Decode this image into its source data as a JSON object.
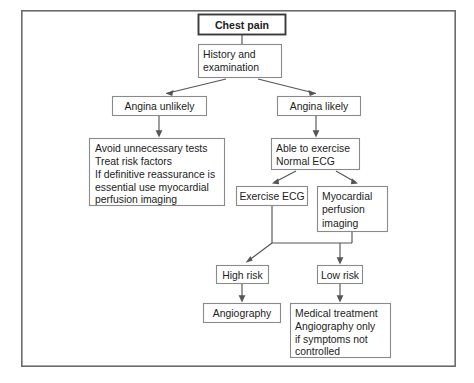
{
  "diagram": {
    "title_node": "Chest pain",
    "frame": {
      "x": 21,
      "y": 10,
      "width": 435,
      "height": 357
    },
    "accent_colors": {
      "frame_border": "#6b6b6b",
      "node_border": "#8a8a8a",
      "emphasis_border": "#3a3a3a",
      "connector": "#555555",
      "text": "#1c1c1c",
      "background": "#ffffff"
    },
    "nodes": [
      {
        "id": "chest-pain",
        "label": "Chest pain",
        "lines": [
          "Chest pain"
        ],
        "bold": true,
        "emphasis": true,
        "align": "center",
        "x": 198,
        "y": 14,
        "width": 88,
        "height": 21
      },
      {
        "id": "history-examination",
        "label": "History and examination",
        "lines": [
          "History and",
          "examination"
        ],
        "bold": false,
        "emphasis": false,
        "align": "left",
        "x": 198,
        "y": 44,
        "width": 84,
        "height": 34
      },
      {
        "id": "angina-unlikely",
        "label": "Angina unlikely",
        "lines": [
          "Angina unlikely"
        ],
        "bold": false,
        "emphasis": false,
        "align": "center",
        "x": 112,
        "y": 96,
        "width": 95,
        "height": 20
      },
      {
        "id": "angina-likely",
        "label": "Angina likely",
        "lines": [
          "Angina likely"
        ],
        "bold": false,
        "emphasis": false,
        "align": "center",
        "x": 277,
        "y": 96,
        "width": 84,
        "height": 20
      },
      {
        "id": "conservative-management",
        "label": "Avoid unnecessary tests",
        "lines": [
          "Avoid unnecessary tests",
          "Treat risk factors",
          "If definitive reassurance is",
          "essential use myocardial",
          "perfusion imaging"
        ],
        "bold": false,
        "emphasis": false,
        "align": "left",
        "x": 89,
        "y": 138,
        "width": 136,
        "height": 68
      },
      {
        "id": "able-to-exercise",
        "label": "Able to exercise Normal ECG",
        "lines": [
          "Able to exercise",
          "Normal ECG"
        ],
        "bold": false,
        "emphasis": false,
        "align": "left",
        "x": 271,
        "y": 138,
        "width": 89,
        "height": 32
      },
      {
        "id": "exercise-ecg",
        "label": "Exercise ECG",
        "lines": [
          "Exercise ECG"
        ],
        "bold": false,
        "emphasis": false,
        "align": "center",
        "x": 236,
        "y": 186,
        "width": 72,
        "height": 20
      },
      {
        "id": "myocardial-perfusion-imaging",
        "label": "Myocardial perfusion imaging",
        "lines": [
          "Myocardial",
          "perfusion",
          "imaging"
        ],
        "bold": false,
        "emphasis": false,
        "align": "left",
        "x": 317,
        "y": 186,
        "width": 71,
        "height": 46
      },
      {
        "id": "high-risk",
        "label": "High risk",
        "lines": [
          "High risk"
        ],
        "bold": false,
        "emphasis": false,
        "align": "center",
        "x": 216,
        "y": 265,
        "width": 53,
        "height": 19
      },
      {
        "id": "low-risk",
        "label": "Low risk",
        "lines": [
          "Low risk"
        ],
        "bold": false,
        "emphasis": false,
        "align": "center",
        "x": 317,
        "y": 265,
        "width": 46,
        "height": 19
      },
      {
        "id": "angiography",
        "label": "Angiography",
        "lines": [
          "Angiography"
        ],
        "bold": false,
        "emphasis": false,
        "align": "center",
        "x": 203,
        "y": 303,
        "width": 78,
        "height": 20
      },
      {
        "id": "medical-treatment",
        "label": "Medical treatment",
        "lines": [
          "Medical treatment",
          "Angiography only",
          "if symptoms not",
          "controlled"
        ],
        "bold": false,
        "emphasis": false,
        "align": "left",
        "x": 290,
        "y": 303,
        "width": 101,
        "height": 55
      }
    ],
    "edges": [
      {
        "id": "chest-pain-to-history",
        "from": "chest-pain",
        "to": "history-examination",
        "kind": "vertical-plain"
      },
      {
        "id": "history-to-angina-unlikely",
        "from": "history-examination",
        "to": "angina-unlikely",
        "kind": "diagonal-arrow"
      },
      {
        "id": "history-to-angina-likely",
        "from": "history-examination",
        "to": "angina-likely",
        "kind": "diagonal-arrow"
      },
      {
        "id": "angina-unlikely-to-conservative",
        "from": "angina-unlikely",
        "to": "conservative-management",
        "kind": "vertical-arrow"
      },
      {
        "id": "angina-likely-to-able-to-exercise",
        "from": "angina-likely",
        "to": "able-to-exercise",
        "kind": "vertical-arrow"
      },
      {
        "id": "able-to-exercise-to-exercise-ecg",
        "from": "able-to-exercise",
        "to": "exercise-ecg",
        "kind": "diagonal-arrow"
      },
      {
        "id": "able-to-exercise-to-myocardial",
        "from": "able-to-exercise",
        "to": "myocardial-perfusion-imaging",
        "kind": "diagonal-arrow"
      },
      {
        "id": "exercise-ecg-to-high-risk",
        "from": "exercise-ecg",
        "to": "high-risk",
        "kind": "bus-diagonal-arrow"
      },
      {
        "id": "myocardial-to-low-risk",
        "from": "myocardial-perfusion-imaging",
        "to": "low-risk",
        "kind": "bus-vertical-arrow"
      },
      {
        "id": "high-risk-to-angiography",
        "from": "high-risk",
        "to": "angiography",
        "kind": "vertical-arrow"
      },
      {
        "id": "low-risk-to-medical-treatment",
        "from": "low-risk",
        "to": "medical-treatment",
        "kind": "vertical-arrow"
      }
    ]
  }
}
